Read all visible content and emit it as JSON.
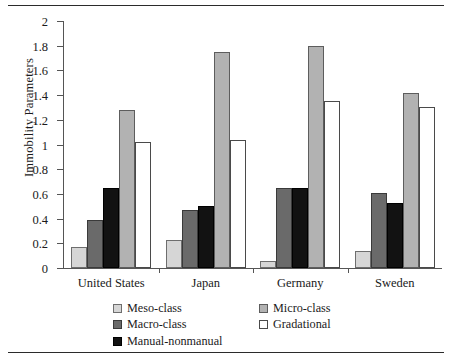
{
  "chart_data": {
    "type": "bar",
    "title": "",
    "xlabel": "",
    "ylabel": "Immobility Parameters",
    "ylim": [
      0,
      2
    ],
    "ytick_labels": [
      "0",
      "0.2",
      "0.4",
      "0.6",
      "0.8",
      "1",
      "1.2",
      "1.4",
      "1.6",
      "1.8",
      "2"
    ],
    "ytick_values": [
      0,
      0.2,
      0.4,
      0.6,
      0.8,
      1.0,
      1.2,
      1.4,
      1.6,
      1.8,
      2.0
    ],
    "grid": false,
    "legend_position": "bottom",
    "categories": [
      "United States",
      "Japan",
      "Germany",
      "Sweden"
    ],
    "series": [
      {
        "name": "Meso-class",
        "color": "#d6d6d6",
        "values": [
          0.17,
          0.23,
          0.06,
          0.14
        ]
      },
      {
        "name": "Macro-class",
        "color": "#6a6a6a",
        "values": [
          0.39,
          0.47,
          0.65,
          0.61
        ]
      },
      {
        "name": "Manual-nonmanual",
        "color": "#121212",
        "values": [
          0.65,
          0.5,
          0.65,
          0.53
        ]
      },
      {
        "name": "Micro-class",
        "color": "#b2b2b2",
        "values": [
          1.28,
          1.75,
          1.8,
          1.42
        ]
      },
      {
        "name": "Gradational",
        "color": "#ffffff",
        "values": [
          1.02,
          1.04,
          1.35,
          1.3
        ]
      }
    ],
    "legend_order": [
      "Meso-class",
      "Micro-class",
      "Macro-class",
      "Gradational",
      "Manual-nonmanual"
    ]
  }
}
